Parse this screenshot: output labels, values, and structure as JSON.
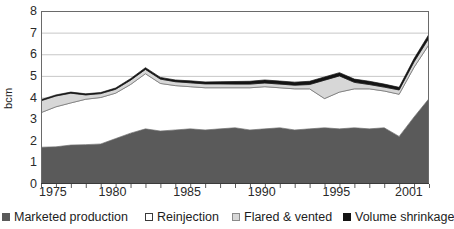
{
  "chart_data": {
    "type": "area",
    "stacked": true,
    "title": "",
    "xlabel": "",
    "ylabel": "bcm",
    "ylim": [
      0,
      8
    ],
    "xlim": [
      1975,
      2001
    ],
    "grid": true,
    "legend_position": "bottom",
    "y_ticks": [
      "8",
      "7",
      "6",
      "5",
      "4",
      "3",
      "2",
      "1",
      "0"
    ],
    "y_tick_values": [
      8,
      7,
      6,
      5,
      4,
      3,
      2,
      1,
      0
    ],
    "x_ticks": [
      "1975",
      "1980",
      "1985",
      "1990",
      "1995",
      "2001"
    ],
    "x_tick_values": [
      1975,
      1980,
      1985,
      1990,
      1995,
      2001
    ],
    "x": [
      1975,
      1976,
      1977,
      1978,
      1979,
      1980,
      1981,
      1982,
      1983,
      1984,
      1985,
      1986,
      1987,
      1988,
      1989,
      1990,
      1991,
      1992,
      1993,
      1994,
      1995,
      1996,
      1997,
      1998,
      1999,
      2000,
      2001
    ],
    "series": [
      {
        "name": "Marketed production",
        "color": "#5a5a5a",
        "values": [
          1.7,
          1.72,
          1.8,
          1.82,
          1.85,
          2.1,
          2.35,
          2.55,
          2.45,
          2.5,
          2.55,
          2.5,
          2.55,
          2.6,
          2.5,
          2.55,
          2.6,
          2.5,
          2.55,
          2.6,
          2.55,
          2.6,
          2.55,
          2.6,
          2.2,
          3.1,
          3.95
        ]
      },
      {
        "name": "Reinjection",
        "color": "#ffffff",
        "values": [
          1.6,
          1.85,
          1.95,
          2.1,
          2.15,
          2.1,
          2.25,
          2.55,
          2.2,
          2.05,
          1.95,
          1.95,
          1.9,
          1.85,
          1.95,
          1.95,
          1.85,
          1.9,
          1.85,
          1.35,
          1.7,
          1.8,
          1.85,
          1.7,
          1.95,
          2.3,
          2.5
        ]
      },
      {
        "name": "Flared & vented",
        "color": "#d7d7d7",
        "values": [
          0.55,
          0.5,
          0.45,
          0.2,
          0.18,
          0.18,
          0.2,
          0.2,
          0.2,
          0.18,
          0.18,
          0.18,
          0.18,
          0.17,
          0.17,
          0.17,
          0.17,
          0.17,
          0.2,
          0.85,
          0.75,
          0.3,
          0.2,
          0.18,
          0.2,
          0.25,
          0.3
        ]
      },
      {
        "name": "Volume shrinkage",
        "color": "#141414",
        "values": [
          0.05,
          0.05,
          0.05,
          0.05,
          0.05,
          0.06,
          0.07,
          0.08,
          0.08,
          0.08,
          0.09,
          0.09,
          0.1,
          0.12,
          0.13,
          0.14,
          0.14,
          0.14,
          0.15,
          0.15,
          0.15,
          0.15,
          0.15,
          0.14,
          0.12,
          0.15,
          0.18
        ]
      }
    ],
    "totals": [
      3.9,
      4.12,
      4.25,
      4.17,
      4.23,
      4.44,
      4.87,
      5.38,
      4.93,
      4.81,
      4.77,
      4.72,
      4.73,
      4.74,
      4.75,
      4.81,
      4.76,
      4.71,
      4.75,
      4.95,
      5.15,
      4.85,
      4.75,
      4.62,
      4.47,
      5.8,
      6.93
    ]
  },
  "legend": {
    "items": [
      {
        "label": "Marketed production",
        "swatch": "filled-dark-gray"
      },
      {
        "label": "Reinjection",
        "swatch": "outlined-white"
      },
      {
        "label": "Flared & vented",
        "swatch": "filled-light-gray"
      },
      {
        "label": "Volume shrinkage",
        "swatch": "filled-black"
      }
    ]
  }
}
